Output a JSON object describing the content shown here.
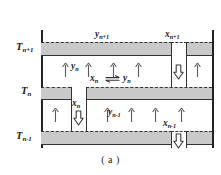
{
  "figure": {
    "caption": "( a )",
    "type": "distillation-column-tray-diagram",
    "colors": {
      "plate_fill": "#c9c9c9",
      "line": "#333333",
      "background": "#ffffff",
      "arrow_stroke": "#555555"
    }
  },
  "stage_labels": [
    {
      "name": "stage-n-plus-1",
      "base": "T",
      "sub": "n+1",
      "text": "Tn+1"
    },
    {
      "name": "stage-n",
      "base": "T",
      "sub": "n",
      "text": "Tn"
    },
    {
      "name": "stage-n-minus-1",
      "base": "T",
      "sub": "n-1",
      "text": "Tn-1"
    }
  ],
  "stream_labels": {
    "vapor_top": {
      "base": "y",
      "sub": "n+1",
      "text": "yn+1"
    },
    "liquid_top": {
      "base": "x",
      "sub": "n+1",
      "text": "xn+1"
    },
    "vapor_stage_n": {
      "base": "y",
      "sub": "n",
      "text": "yn"
    },
    "liquid_stage_n": {
      "base": "x",
      "sub": "n",
      "text": "xn"
    },
    "vapor_bottom": {
      "base": "y",
      "sub": "n-1",
      "text": "yn-1"
    },
    "liquid_bottom": {
      "base": "x",
      "sub": "n-1",
      "text": "xn-1"
    },
    "equilibrium_left": {
      "base": "x",
      "sub": "n",
      "text": "xn"
    },
    "equilibrium_right": {
      "base": "y",
      "sub": "n",
      "text": "yn"
    }
  }
}
